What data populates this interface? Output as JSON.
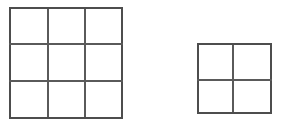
{
  "figure": {
    "background_color": "#ffffff",
    "line_color": "#5a5a5a",
    "outer_line_color": "#4d4d4d",
    "canvas": {
      "width": 284,
      "height": 124
    },
    "shape_count": 2,
    "grids": [
      {
        "id": "left-grid",
        "name": "three-by-three-grid",
        "rows": 3,
        "cols": 3,
        "cell_count": 9,
        "x": 10,
        "y": 8,
        "width": 112,
        "height": 110,
        "x_lines": [
          10,
          48,
          85,
          122
        ],
        "y_lines": [
          8,
          44,
          81,
          118
        ]
      },
      {
        "id": "right-grid",
        "name": "two-by-two-grid",
        "rows": 2,
        "cols": 2,
        "cell_count": 4,
        "x": 198,
        "y": 44,
        "width": 73,
        "height": 69,
        "x_lines": [
          198,
          233,
          271
        ],
        "y_lines": [
          44,
          80,
          113
        ]
      }
    ]
  }
}
